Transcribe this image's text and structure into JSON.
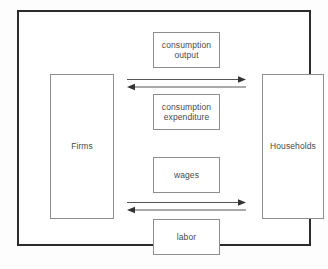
{
  "diagram": {
    "frame": {
      "border_color": "#2b2b2b"
    },
    "actors": [
      {
        "id": "firms",
        "label": "Firms",
        "side": "left"
      },
      {
        "id": "households",
        "label": "Households",
        "side": "right"
      }
    ],
    "flow_labels": [
      {
        "id": "consumption-output",
        "label": "consumption\noutput"
      },
      {
        "id": "consumption-expenditure",
        "label": "consumption\nexpenditure"
      },
      {
        "id": "wages",
        "label": "wages"
      },
      {
        "id": "labor",
        "label": "labor"
      }
    ],
    "arrows": [
      {
        "id": "upper-rightward",
        "direction": "right",
        "from": "firms",
        "to": "households",
        "color": "#555555"
      },
      {
        "id": "upper-leftward",
        "direction": "left",
        "from": "households",
        "to": "firms",
        "color": "#555555"
      },
      {
        "id": "lower-rightward",
        "direction": "right",
        "from": "firms",
        "to": "households",
        "color": "#555555"
      },
      {
        "id": "lower-leftward",
        "direction": "left",
        "from": "households",
        "to": "firms",
        "color": "#555555"
      }
    ],
    "colors": {
      "frame_border": "#2b2b2b",
      "box_border": "#8d8d8d",
      "text": "#4a4a4a",
      "arrow": "#555555",
      "background": "#ffffff"
    }
  }
}
